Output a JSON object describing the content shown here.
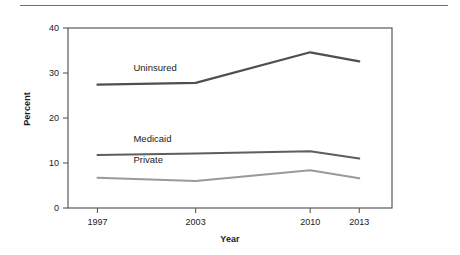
{
  "figure": {
    "name": "health-insurance-coverage-line-chart"
  },
  "axis_titles": {
    "y": "Percent",
    "x": "Year"
  },
  "chart_data": {
    "type": "line",
    "title": "",
    "subtitle": "",
    "xlabel": "Year",
    "ylabel": "Percent",
    "categories": [
      "1997",
      "2003",
      "2010",
      "2013"
    ],
    "x": [
      1997,
      2003,
      2010,
      2013
    ],
    "xlim": [
      1995.2,
      2015.0
    ],
    "ylim": [
      0,
      40
    ],
    "ytick_labels": [
      "0",
      "10",
      "20",
      "30",
      "40"
    ],
    "yticks": [
      0,
      10,
      20,
      30,
      40
    ],
    "xtick_labels": [
      "1997",
      "2003",
      "2010",
      "2013"
    ],
    "grid": false,
    "legend": "inline-labels",
    "series": [
      {
        "name": "Uninsured",
        "label": "Uninsured",
        "color": "#4f4f4f",
        "width": 2.2,
        "values": [
          27.4,
          27.8,
          34.6,
          32.6
        ],
        "label_x": 1999.2,
        "label_y": 30.5
      },
      {
        "name": "Medicaid",
        "label": "Medicaid",
        "color": "#5e5e5e",
        "width": 2.0,
        "values": [
          11.8,
          12.1,
          12.6,
          11.0
        ],
        "label_x": 1999.2,
        "label_y": 14.6
      },
      {
        "name": "Private",
        "label": "Private",
        "color": "#9a9a9a",
        "width": 2.0,
        "values": [
          6.7,
          6.0,
          8.4,
          6.6
        ],
        "label_x": 1999.2,
        "label_y": 9.9
      }
    ]
  },
  "colors": {
    "axis": "#5a5a5a",
    "rule": "#6e6e6e",
    "text": "#1a1a1a",
    "background": "#ffffff"
  }
}
